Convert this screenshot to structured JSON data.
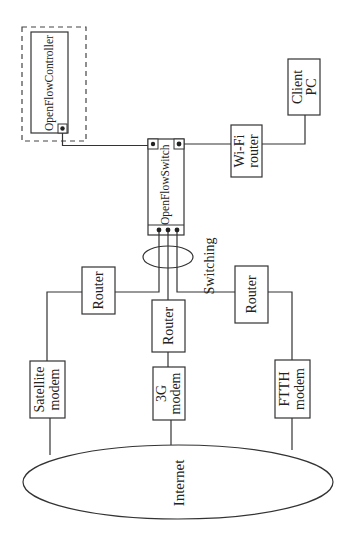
{
  "diagram": {
    "title": "",
    "orientation": "rotated-90-ccw",
    "nodes": {
      "controller": {
        "label": "OpenFlowController",
        "group": "dashed-boundary"
      },
      "switch": {
        "label": "OpenFlowSwitch"
      },
      "wifi_router": {
        "line1": "Wi-Fi",
        "line2": "router"
      },
      "client_pc": {
        "line1": "Client",
        "line2": "PC"
      },
      "switching": {
        "label": "Switching"
      },
      "router_left": {
        "label": "Router"
      },
      "router_center": {
        "label": "Router"
      },
      "router_right": {
        "label": "Router"
      },
      "satellite_modem": {
        "line1": "Satellite",
        "line2": "modem"
      },
      "modem_3g": {
        "line1": "3G",
        "line2": "modem"
      },
      "ftth_modem": {
        "line1": "FTTH",
        "line2": "modem"
      },
      "internet": {
        "label": "Internet"
      }
    },
    "edges": [
      [
        "controller",
        "switch"
      ],
      [
        "switch",
        "wifi_router"
      ],
      [
        "wifi_router",
        "client_pc"
      ],
      [
        "switch",
        "router_left"
      ],
      [
        "switch",
        "router_center"
      ],
      [
        "switch",
        "router_right"
      ],
      [
        "router_left",
        "satellite_modem"
      ],
      [
        "router_center",
        "modem_3g"
      ],
      [
        "router_right",
        "ftth_modem"
      ],
      [
        "satellite_modem",
        "internet"
      ],
      [
        "modem_3g",
        "internet"
      ],
      [
        "ftth_modem",
        "internet"
      ]
    ],
    "colors": {
      "stroke": "#333333",
      "background": "#ffffff",
      "text": "#222222"
    }
  }
}
